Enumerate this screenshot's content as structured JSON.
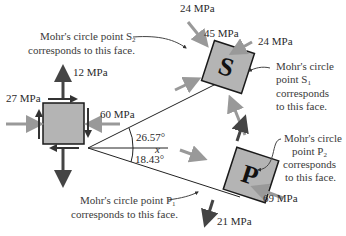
{
  "diagram": {
    "original_element": {
      "stress_labels": {
        "vertical": "12 MPa",
        "shear": "27 MPa",
        "horizontal": "60 MPa"
      }
    },
    "angles": {
      "upper": "26.57°",
      "lower": "18.43°",
      "axis": "x"
    },
    "s_element": {
      "label": "S",
      "stress_labels": {
        "top_arrow": "24 MPa",
        "shear": "45 MPa",
        "right_arrow": "24 MPa"
      },
      "note_s2": {
        "line1": "Mohr's circle point S",
        "sub": "2",
        "line2": "corresponds to this face."
      },
      "note_s1": {
        "line1": "Mohr's circle",
        "line2a": "point S",
        "sub": "1",
        "line3": "corresponds",
        "line4": "to this face."
      }
    },
    "p_element": {
      "label": "P",
      "stress_labels": {
        "right_arrow": "69 MPa",
        "bottom_arrow": "21 MPa"
      },
      "note_p2": {
        "line1": "Mohr's circle",
        "line2a": "point P",
        "sub": "2",
        "line3": "corresponds",
        "line4": "to this face."
      },
      "note_p1": {
        "line1": "Mohr's circle point P",
        "sub": "1",
        "line2": "corresponds to this face."
      }
    },
    "colors": {
      "element_fill": "#b4b4b4",
      "arrow": "#4a4a4a",
      "gray_arrow": "#9a9a9a",
      "outline": "#1a1a1a"
    }
  }
}
